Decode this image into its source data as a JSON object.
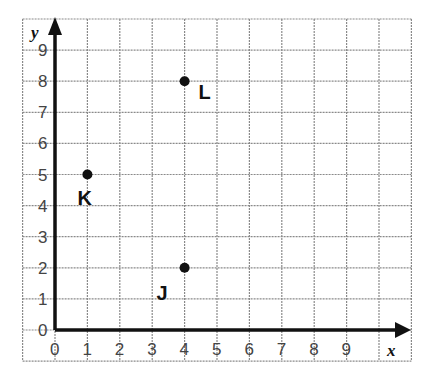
{
  "chart_data": {
    "type": "scatter",
    "title": "",
    "xlabel": "x",
    "ylabel": "y",
    "xlim": [
      0,
      10
    ],
    "ylim": [
      0,
      9.7
    ],
    "grid": true,
    "x_ticks": [
      "0",
      "1",
      "2",
      "3",
      "4",
      "5",
      "6",
      "7",
      "8",
      "9"
    ],
    "y_ticks": [
      "0",
      "1",
      "2",
      "3",
      "4",
      "5",
      "6",
      "7",
      "8",
      "9"
    ],
    "points": [
      {
        "label": "K",
        "x": 1,
        "y": 5
      },
      {
        "label": "L",
        "x": 4,
        "y": 8
      },
      {
        "label": "J",
        "x": 4,
        "y": 2
      }
    ]
  },
  "colors": {
    "grid": "#8a8a8a",
    "axis": "#111111",
    "point": "#111111"
  }
}
